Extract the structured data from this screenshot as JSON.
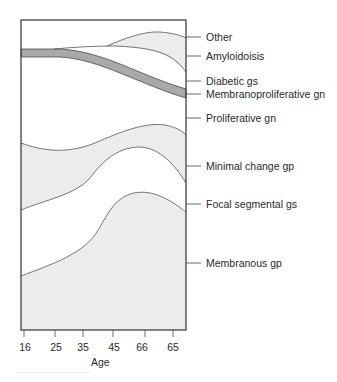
{
  "figure": {
    "type": "stacked-area-diagram",
    "x_axis": {
      "title": "Age",
      "ticks": [
        "16",
        "25",
        "35",
        "45",
        "66",
        "65"
      ]
    },
    "legend_labels": [
      "Other",
      "Amyloidoisis",
      "Diabetic gs",
      "Membranoproliferative gn",
      "Proliferative gn",
      "Minimal change gp",
      "Focal segmental gs",
      "Membranous gp"
    ],
    "colors": {
      "light_fill": "#ececec",
      "dark_band": "#a9a9a9",
      "outline": "#4a4a4a",
      "background": "#ffffff"
    }
  }
}
